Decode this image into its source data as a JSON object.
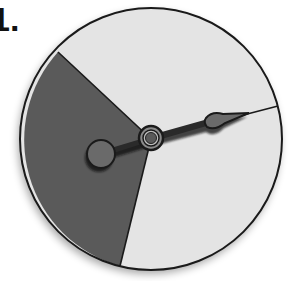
{
  "problem": {
    "number_label": "1."
  },
  "spinner": {
    "center": [
      151,
      139
    ],
    "radius": 131,
    "sectors": [
      {
        "name": "dark-sector",
        "color": "#5a5a5a",
        "start_point": [
          58,
          52
        ],
        "end_point": [
          120,
          264
        ],
        "fraction_estimate": "about 1/3"
      },
      {
        "name": "light-sector-top",
        "color": "#e4e4e4",
        "start_point": [
          58,
          52
        ],
        "end_point": [
          277,
          106
        ]
      },
      {
        "name": "light-sector-bottom",
        "color": "#e4e4e4",
        "start_point": [
          277,
          106
        ],
        "end_point": [
          120,
          264
        ]
      }
    ],
    "border_color": "#1a1a1a",
    "pointer": {
      "color": "#6a6a6a",
      "tail_center": [
        101,
        154
      ],
      "tail_radius": 14,
      "tip": [
        249,
        113
      ]
    }
  }
}
